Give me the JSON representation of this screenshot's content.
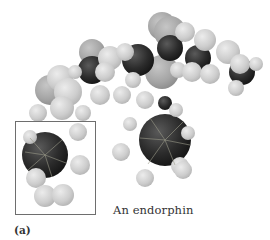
{
  "figure": {
    "caption": "An endorphin",
    "panel_label": "(a)",
    "model_type": "space-filling molecular model",
    "highlight_box": "boxed tyrosine ring region"
  },
  "colors": {
    "carbon": "#2a2a2a",
    "heteroatom": "#a9a9a9",
    "hydrogen": "#cfcfcf",
    "box_border": "#6e6e6e",
    "caption_text": "#333333"
  },
  "atoms": [
    {
      "type": "H",
      "x": 60,
      "y": 78,
      "r": 13
    },
    {
      "type": "O",
      "x": 50,
      "y": 90,
      "r": 15
    },
    {
      "type": "H",
      "x": 68,
      "y": 92,
      "r": 14
    },
    {
      "type": "H",
      "x": 62,
      "y": 108,
      "r": 12
    },
    {
      "type": "H",
      "x": 38,
      "y": 113,
      "r": 9
    },
    {
      "type": "H",
      "x": 83,
      "y": 113,
      "r": 8
    },
    {
      "type": "H",
      "x": 75,
      "y": 72,
      "r": 7
    },
    {
      "type": "O",
      "x": 92,
      "y": 52,
      "r": 13
    },
    {
      "type": "C",
      "x": 92,
      "y": 70,
      "r": 14
    },
    {
      "type": "H",
      "x": 100,
      "y": 95,
      "r": 10
    },
    {
      "type": "H",
      "x": 110,
      "y": 58,
      "r": 12
    },
    {
      "type": "H",
      "x": 105,
      "y": 72,
      "r": 10
    },
    {
      "type": "C",
      "x": 138,
      "y": 60,
      "r": 16
    },
    {
      "type": "H",
      "x": 125,
      "y": 52,
      "r": 9
    },
    {
      "type": "H",
      "x": 133,
      "y": 80,
      "r": 8
    },
    {
      "type": "H",
      "x": 122,
      "y": 95,
      "r": 9
    },
    {
      "type": "H",
      "x": 145,
      "y": 100,
      "r": 9
    },
    {
      "type": "O",
      "x": 162,
      "y": 26,
      "r": 14
    },
    {
      "type": "O",
      "x": 170,
      "y": 32,
      "r": 16
    },
    {
      "type": "H",
      "x": 185,
      "y": 32,
      "r": 10
    },
    {
      "type": "C",
      "x": 170,
      "y": 48,
      "r": 13
    },
    {
      "type": "O",
      "x": 162,
      "y": 72,
      "r": 17
    },
    {
      "type": "H",
      "x": 178,
      "y": 70,
      "r": 8
    },
    {
      "type": "C",
      "x": 198,
      "y": 58,
      "r": 13
    },
    {
      "type": "H",
      "x": 205,
      "y": 40,
      "r": 11
    },
    {
      "type": "H",
      "x": 192,
      "y": 72,
      "r": 10
    },
    {
      "type": "H",
      "x": 210,
      "y": 74,
      "r": 10
    },
    {
      "type": "H",
      "x": 228,
      "y": 52,
      "r": 12
    },
    {
      "type": "C",
      "x": 242,
      "y": 72,
      "r": 13
    },
    {
      "type": "H",
      "x": 240,
      "y": 64,
      "r": 10
    },
    {
      "type": "H",
      "x": 256,
      "y": 64,
      "r": 7
    },
    {
      "type": "H",
      "x": 236,
      "y": 88,
      "r": 8
    },
    {
      "type": "C",
      "x": 165,
      "y": 103,
      "r": 7
    },
    {
      "type": "H",
      "x": 176,
      "y": 110,
      "r": 7
    },
    {
      "type": "H",
      "x": 130,
      "y": 124,
      "r": 7
    },
    {
      "type": "H",
      "x": 188,
      "y": 133,
      "r": 7
    },
    {
      "type": "C",
      "x": 165,
      "y": 140,
      "r": 26
    },
    {
      "type": "H",
      "x": 121,
      "y": 152,
      "r": 9
    },
    {
      "type": "H",
      "x": 145,
      "y": 178,
      "r": 9
    },
    {
      "type": "H",
      "x": 180,
      "y": 166,
      "r": 9
    },
    {
      "type": "H",
      "x": 183,
      "y": 170,
      "r": 9
    },
    {
      "type": "H",
      "x": 30,
      "y": 137,
      "r": 7
    },
    {
      "type": "H",
      "x": 78,
      "y": 132,
      "r": 9
    },
    {
      "type": "C",
      "x": 45,
      "y": 155,
      "r": 23
    },
    {
      "type": "H",
      "x": 80,
      "y": 165,
      "r": 10
    },
    {
      "type": "H",
      "x": 36,
      "y": 178,
      "r": 10
    },
    {
      "type": "H",
      "x": 45,
      "y": 196,
      "r": 11
    },
    {
      "type": "H",
      "x": 63,
      "y": 195,
      "r": 11
    }
  ]
}
